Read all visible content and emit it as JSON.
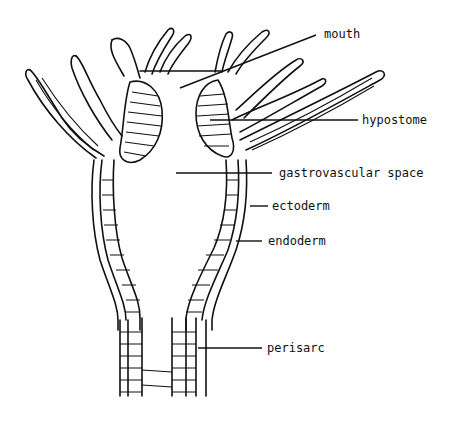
{
  "diagram": {
    "labels": [
      {
        "id": "mouth",
        "text": "mouth"
      },
      {
        "id": "hypostome",
        "text": "hypostome"
      },
      {
        "id": "gastrovascular",
        "text": "gastrovascular space"
      },
      {
        "id": "ectoderm",
        "text": "ectoderm"
      },
      {
        "id": "endoderm",
        "text": "endoderm"
      },
      {
        "id": "perisarc",
        "text": "perisarc"
      }
    ],
    "colors": {
      "ink": "#111111",
      "background": "#ffffff"
    }
  }
}
